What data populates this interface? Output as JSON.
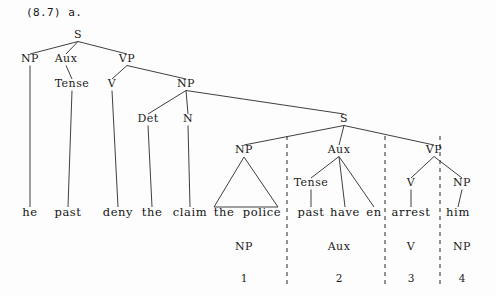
{
  "header": {
    "example_number": "(8.7) a."
  },
  "colors": {
    "ink": "#1b1b1b",
    "line": "#2a2a2a",
    "divider": "#3a3a3a",
    "page": "#fdfdfd"
  },
  "tree": {
    "nodes": [
      {
        "id": "s-top",
        "label": "S",
        "x": 78,
        "y": 38
      },
      {
        "id": "np-subj",
        "label": "NP",
        "x": 30,
        "y": 62
      },
      {
        "id": "aux-main",
        "label": "Aux",
        "x": 66,
        "y": 62
      },
      {
        "id": "vp-main",
        "label": "VP",
        "x": 127,
        "y": 62
      },
      {
        "id": "tense-main",
        "label": "Tense",
        "x": 72,
        "y": 87
      },
      {
        "id": "v-main",
        "label": "V",
        "x": 112,
        "y": 87
      },
      {
        "id": "np-obj",
        "label": "NP",
        "x": 186,
        "y": 87
      },
      {
        "id": "det-obj",
        "label": "Det",
        "x": 148,
        "y": 122
      },
      {
        "id": "n-obj",
        "label": "N",
        "x": 188,
        "y": 122
      },
      {
        "id": "s-embed",
        "label": "S",
        "x": 344,
        "y": 122
      },
      {
        "id": "np-embed",
        "label": "NP",
        "x": 244,
        "y": 153
      },
      {
        "id": "aux-embed",
        "label": "Aux",
        "x": 339,
        "y": 153
      },
      {
        "id": "vp-embed",
        "label": "VP",
        "x": 434,
        "y": 153
      },
      {
        "id": "tense-embed",
        "label": "Tense",
        "x": 311,
        "y": 186
      },
      {
        "id": "v-embed",
        "label": "V",
        "x": 411,
        "y": 186
      },
      {
        "id": "np-embed-obj",
        "label": "NP",
        "x": 462,
        "y": 186
      }
    ],
    "edges": [
      {
        "from": "s-top",
        "to": "np-subj"
      },
      {
        "from": "s-top",
        "to": "aux-main"
      },
      {
        "from": "s-top",
        "to": "vp-main"
      },
      {
        "from": "aux-main",
        "to": "tense-main"
      },
      {
        "from": "vp-main",
        "to": "v-main"
      },
      {
        "from": "vp-main",
        "to": "np-obj"
      },
      {
        "from": "np-obj",
        "to": "det-obj"
      },
      {
        "from": "np-obj",
        "to": "n-obj"
      },
      {
        "from": "np-obj",
        "to": "s-embed"
      },
      {
        "from": "s-embed",
        "to": "np-embed"
      },
      {
        "from": "s-embed",
        "to": "aux-embed"
      },
      {
        "from": "s-embed",
        "to": "vp-embed"
      },
      {
        "from": "aux-embed",
        "to": "tense-embed"
      },
      {
        "from": "vp-embed",
        "to": "v-embed"
      },
      {
        "from": "vp-embed",
        "to": "np-embed-obj"
      }
    ],
    "leaf_edges": [
      {
        "from": "np-subj",
        "word": "he"
      },
      {
        "from": "tense-main",
        "word": "past"
      },
      {
        "from": "v-main",
        "word": "deny"
      },
      {
        "from": "det-obj",
        "word": "the"
      },
      {
        "from": "n-obj",
        "word": "claim"
      },
      {
        "from": "aux-embed",
        "word": "have"
      },
      {
        "from": "aux-embed",
        "word": "en"
      },
      {
        "from": "tense-embed",
        "word": "past"
      },
      {
        "from": "v-embed",
        "word": "arrest"
      },
      {
        "from": "np-embed-obj",
        "word": "him"
      }
    ],
    "triangles": [
      {
        "id": "np-embed-triangle",
        "apex": "np-embed",
        "left_x": 214,
        "right_x": 278,
        "base_y": 207,
        "covers": "the police"
      }
    ],
    "words": [
      {
        "id": "word-he",
        "text": "he",
        "x": 30,
        "y": 216
      },
      {
        "id": "word-past-1",
        "text": "past",
        "x": 68,
        "y": 216
      },
      {
        "id": "word-deny",
        "text": "deny",
        "x": 118,
        "y": 216
      },
      {
        "id": "word-the-1",
        "text": "the",
        "x": 152,
        "y": 216
      },
      {
        "id": "word-claim",
        "text": "claim",
        "x": 190,
        "y": 216
      },
      {
        "id": "word-the-2",
        "text": "the",
        "x": 224,
        "y": 216
      },
      {
        "id": "word-police",
        "text": "police",
        "x": 262,
        "y": 216
      },
      {
        "id": "word-past-2",
        "text": "past",
        "x": 311,
        "y": 216
      },
      {
        "id": "word-have",
        "text": "have",
        "x": 345,
        "y": 216
      },
      {
        "id": "word-en",
        "text": "en",
        "x": 374,
        "y": 216
      },
      {
        "id": "word-arrest",
        "text": "arrest",
        "x": 411,
        "y": 216
      },
      {
        "id": "word-him",
        "text": "him",
        "x": 458,
        "y": 216
      }
    ],
    "dividers": [
      {
        "id": "divider-1",
        "x": 287,
        "y1": 136,
        "y2": 288
      },
      {
        "id": "divider-2",
        "x": 385,
        "y1": 136,
        "y2": 288
      },
      {
        "id": "divider-3",
        "x": 440,
        "y1": 136,
        "y2": 288
      }
    ],
    "footer_row": {
      "labels": [
        {
          "id": "foot-np-1",
          "text": "NP",
          "x": 244,
          "y": 250
        },
        {
          "id": "foot-aux",
          "text": "Aux",
          "x": 339,
          "y": 250
        },
        {
          "id": "foot-v",
          "text": "V",
          "x": 411,
          "y": 250
        },
        {
          "id": "foot-np-2",
          "text": "NP",
          "x": 462,
          "y": 250
        }
      ],
      "indices": [
        {
          "id": "index-1",
          "text": "1",
          "x": 244,
          "y": 282
        },
        {
          "id": "index-2",
          "text": "2",
          "x": 339,
          "y": 282
        },
        {
          "id": "index-3",
          "text": "3",
          "x": 411,
          "y": 282
        },
        {
          "id": "index-4",
          "text": "4",
          "x": 462,
          "y": 282
        }
      ]
    }
  }
}
